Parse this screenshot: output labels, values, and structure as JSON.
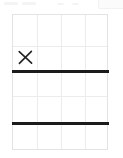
{
  "page": {
    "background_color": "#ffffff"
  },
  "top_chrome": {
    "visible": true,
    "description": "faint partial toolbar remnants at top of capture",
    "ghost_color": "#f4f4f5",
    "panel": {
      "name": "ghost-panel",
      "color": "#fbfbfc",
      "border_color": "#f2f2f3",
      "left": 98,
      "top": 0,
      "width": 25,
      "height": 9
    },
    "pills": [
      {
        "left": 4,
        "top": 2,
        "width": 14,
        "height": 3
      },
      {
        "left": 22,
        "top": 2,
        "width": 14,
        "height": 3
      },
      {
        "left": 57,
        "top": 3,
        "width": 7,
        "height": 2
      },
      {
        "left": 72,
        "top": 3,
        "width": 7,
        "height": 2
      }
    ]
  },
  "grid": {
    "name": "grid-sheet",
    "left": 12,
    "top": 14,
    "width": 96,
    "height": 136,
    "columns": 4,
    "rows": 5,
    "border_color": "#e3e3e5",
    "gridline_color": "#ececee",
    "fill_color": "#ffffff",
    "vertical_lines": [
      24,
      48,
      72
    ],
    "horizontal_lines": [
      31,
      56,
      81,
      108
    ]
  },
  "rules": {
    "color": "#1b1b1b",
    "thickness": 3,
    "items": [
      {
        "label": "upper-rule",
        "top": 55
      },
      {
        "label": "lower-rule",
        "top": 107
      }
    ]
  },
  "marks": {
    "color": "#222222",
    "items": [
      {
        "label": "x-mark",
        "glyph": "X",
        "left": 4,
        "top": 34,
        "size": 17,
        "cell_row": 2,
        "cell_column": 1
      }
    ]
  }
}
